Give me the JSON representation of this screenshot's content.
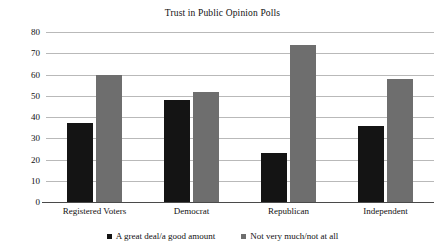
{
  "chart_data": {
    "type": "bar",
    "title": "Trust in Public Opinion Polls",
    "xlabel": "",
    "ylabel": "",
    "categories": [
      "Registered Voters",
      "Democrat",
      "Republican",
      "Independent"
    ],
    "series": [
      {
        "name": "A great deal/a good amount",
        "color": "#141414",
        "values": [
          37,
          48,
          23,
          36
        ]
      },
      {
        "name": "Not very much/not at all",
        "color": "#6e6e6e",
        "values": [
          60,
          52,
          74,
          58
        ]
      }
    ],
    "ylim": [
      0,
      80
    ],
    "yticks": [
      0,
      10,
      20,
      30,
      40,
      50,
      60,
      70,
      80
    ],
    "ytick_labels": [
      "0",
      "10",
      "20",
      "30",
      "40",
      "50",
      "60",
      "70",
      "80"
    ],
    "grid": true,
    "legend_position": "bottom-center"
  },
  "legend": {
    "items": [
      {
        "label": "A great deal/a good amount",
        "marker": "filled-square",
        "color": "#141414"
      },
      {
        "label": "Not very much/not at all",
        "marker": "filled-square",
        "color": "#6e6e6e"
      }
    ]
  }
}
